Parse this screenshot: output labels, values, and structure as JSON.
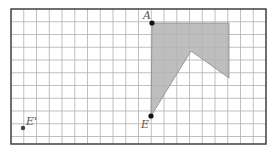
{
  "figure": {
    "frame": {
      "x": 11,
      "y": 9,
      "width": 255,
      "height": 135
    },
    "grid": {
      "cell": 12.75,
      "columns": 20,
      "line_color": "#b0b0b0",
      "frame_color": "#333333"
    },
    "shape": {
      "fill": "#b3b3b3",
      "stroke": "#8a8a8a",
      "vertices": [
        [
          152,
          23
        ],
        [
          229,
          23
        ],
        [
          229,
          78
        ],
        [
          191,
          51
        ],
        [
          151,
          116
        ]
      ]
    },
    "points": [
      {
        "name": "A",
        "x": 152,
        "y": 23,
        "label_dx": -9,
        "label_dy": -4
      },
      {
        "name": "E",
        "x": 151,
        "y": 116,
        "label_dx": -10,
        "label_dy": 12
      },
      {
        "name": "E'",
        "x": 23,
        "y": 128,
        "label_dx": 3,
        "label_dy": -3
      }
    ],
    "labels": {
      "a": "A",
      "e": "E",
      "e_prime": "E'"
    }
  }
}
